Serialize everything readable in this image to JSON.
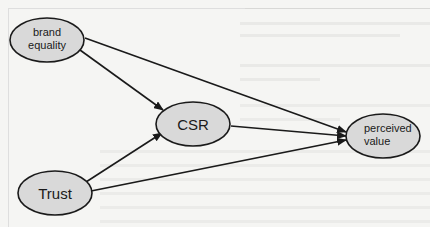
{
  "diagram": {
    "type": "directed-graph",
    "colors": {
      "node_fill": "#d9d9d9",
      "node_stroke": "#1a1a1a",
      "edge_stroke": "#1a1a1a",
      "background": "#f5f5f3"
    },
    "nodes": [
      {
        "id": "brand_equality",
        "label_lines": [
          "brand",
          "equality"
        ]
      },
      {
        "id": "csr",
        "label_lines": [
          "CSR"
        ]
      },
      {
        "id": "trust",
        "label_lines": [
          "Trust"
        ]
      },
      {
        "id": "perceived_value",
        "label_lines": [
          "perceived",
          "value"
        ]
      }
    ],
    "edges": [
      {
        "from": "brand_equality",
        "to": "csr"
      },
      {
        "from": "brand_equality",
        "to": "perceived_value"
      },
      {
        "from": "trust",
        "to": "csr"
      },
      {
        "from": "trust",
        "to": "perceived_value"
      },
      {
        "from": "csr",
        "to": "perceived_value"
      }
    ]
  }
}
